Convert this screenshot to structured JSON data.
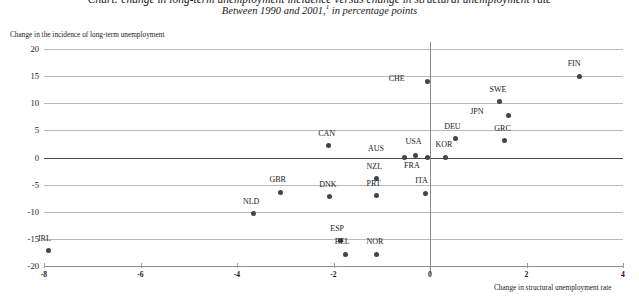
{
  "figure": {
    "title": "Chart: change in long-term unemployment incidence versus change in structural unemployment rate",
    "subtitle_prefix": "Between 1990 and 2001,",
    "subtitle_footnote": "1",
    "subtitle_suffix": " in percentage points"
  },
  "chart_data": {
    "type": "scatter",
    "xlabel": "Change in structural unemployment rate",
    "ylabel": "Change in the incidence of long-term unemployment",
    "xlim": [
      -8,
      4
    ],
    "ylim": [
      -20,
      20
    ],
    "xticks": [
      -8,
      -6,
      -4,
      -2,
      0,
      2,
      4
    ],
    "yticks": [
      20,
      15,
      10,
      5,
      0,
      -5,
      -10,
      -15,
      -20
    ],
    "xtick_labels": [
      "-8",
      "-6",
      "-4",
      "-2",
      "0",
      "2",
      "4"
    ],
    "ytick_labels": [
      "20",
      "15",
      "10",
      "5",
      "0",
      "-5",
      "-10",
      "-15",
      "-20"
    ],
    "grid": "horizontal",
    "legend": "none",
    "marker_color": "#444444",
    "points": [
      {
        "label": "FIN",
        "x": 3.1,
        "y": 15.0,
        "label_dx": -0.06,
        "label_dy": 2.2
      },
      {
        "label": "CHE",
        "x": -0.05,
        "y": 14.0,
        "label_dx": -0.62,
        "label_dy": 0.5
      },
      {
        "label": "SWE",
        "x": 1.45,
        "y": 10.3,
        "label_dx": -0.03,
        "label_dy": 2.2
      },
      {
        "label": "JPN",
        "x": 1.62,
        "y": 7.7,
        "label_dx": -0.6,
        "label_dy": 0.6
      },
      {
        "label": "DEU",
        "x": 0.52,
        "y": 3.5,
        "label_dx": -0.04,
        "label_dy": 2.2
      },
      {
        "label": "GRC",
        "x": 1.55,
        "y": 3.1,
        "label_dx": -0.03,
        "label_dy": 2.2
      },
      {
        "label": "CAN",
        "x": -2.1,
        "y": 2.2,
        "label_dx": -0.03,
        "label_dy": 2.2
      },
      {
        "label": "KOR",
        "x": 0.33,
        "y": 0.0,
        "label_dx": -0.03,
        "label_dy": 2.3
      },
      {
        "label": "USA",
        "x": -0.3,
        "y": 0.4,
        "label_dx": -0.02,
        "label_dy": 2.4
      },
      {
        "label": "AUS",
        "x": -0.52,
        "y": 0.0,
        "label_dx": -0.58,
        "label_dy": 1.5
      },
      {
        "label": "FRA",
        "x": -0.05,
        "y": 0.0,
        "label_dx": -0.3,
        "label_dy": -1.5
      },
      {
        "label": "NZL",
        "x": -1.1,
        "y": -3.9,
        "label_dx": -0.03,
        "label_dy": 2.2
      },
      {
        "label": "GBR",
        "x": -3.1,
        "y": -6.4,
        "label_dx": -0.04,
        "label_dy": 2.2
      },
      {
        "label": "ITA",
        "x": -0.1,
        "y": -6.6,
        "label_dx": -0.02,
        "label_dy": 2.2
      },
      {
        "label": "PRT",
        "x": -1.1,
        "y": -7.0,
        "label_dx": -0.03,
        "label_dy": 2.2
      },
      {
        "label": "DNK",
        "x": -2.08,
        "y": -7.2,
        "label_dx": -0.03,
        "label_dy": 2.2
      },
      {
        "label": "NLD",
        "x": -3.65,
        "y": -10.4,
        "label_dx": -0.04,
        "label_dy": 2.2
      },
      {
        "label": "ESP",
        "x": -1.85,
        "y": -15.3,
        "label_dx": -0.03,
        "label_dy": 2.2
      },
      {
        "label": "BEL",
        "x": -1.75,
        "y": -17.8,
        "label_dx": -0.04,
        "label_dy": 2.2
      },
      {
        "label": "NOR",
        "x": -1.1,
        "y": -17.8,
        "label_dx": -0.03,
        "label_dy": 2.2
      },
      {
        "label": "IRL",
        "x": -7.9,
        "y": -17.2,
        "label_dx": -0.04,
        "label_dy": 2.2
      }
    ]
  }
}
